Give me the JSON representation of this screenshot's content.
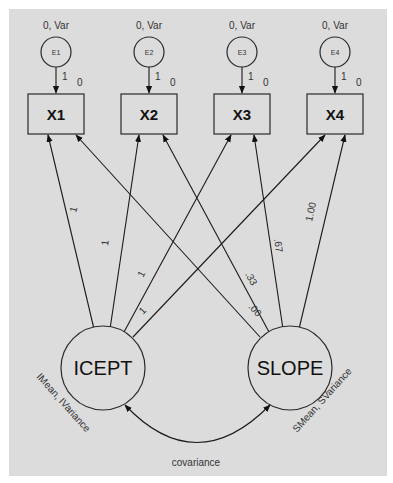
{
  "diagram": {
    "type": "structural-equation-model",
    "background_color": "#dcdcdc",
    "errors": [
      {
        "id": "E1",
        "label": "E1",
        "param": "0, Var",
        "loading": "1",
        "intercept": "0"
      },
      {
        "id": "E2",
        "label": "E2",
        "param": "0, Var",
        "loading": "1",
        "intercept": "0"
      },
      {
        "id": "E3",
        "label": "E3",
        "param": "0, Var",
        "loading": "1",
        "intercept": "0"
      },
      {
        "id": "E4",
        "label": "E4",
        "param": "0, Var",
        "loading": "1",
        "intercept": "0"
      }
    ],
    "observed": [
      {
        "id": "X1",
        "label": "X1"
      },
      {
        "id": "X2",
        "label": "X2"
      },
      {
        "id": "X3",
        "label": "X3"
      },
      {
        "id": "X4",
        "label": "X4"
      }
    ],
    "latent": [
      {
        "id": "ICEPT",
        "label": "ICEPT",
        "param": "IMean, IVariance"
      },
      {
        "id": "SLOPE",
        "label": "SLOPE",
        "param": "SMean, SVariance"
      }
    ],
    "paths": {
      "icept": [
        {
          "to": "X1",
          "weight": "1"
        },
        {
          "to": "X2",
          "weight": "1"
        },
        {
          "to": "X3",
          "weight": "1"
        },
        {
          "to": "X4",
          "weight": "1"
        }
      ],
      "slope": [
        {
          "to": "X1",
          "weight": ".00"
        },
        {
          "to": "X2",
          "weight": ".33"
        },
        {
          "to": "X3",
          "weight": ".67"
        },
        {
          "to": "X4",
          "weight": "1.00"
        }
      ]
    },
    "covariance_label": "covariance"
  }
}
